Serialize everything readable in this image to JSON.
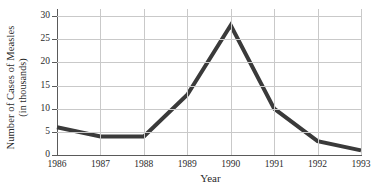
{
  "chart_data": {
    "type": "line",
    "title": "",
    "xlabel": "Year",
    "ylabel": "Number of Cases of Measles (in thousands)",
    "ylabel_line1": "Number of Cases of Measles",
    "ylabel_line2": "(in thousands)",
    "categories": [
      "1986",
      "1987",
      "1988",
      "1989",
      "1990",
      "1991",
      "1992",
      "1993"
    ],
    "values": [
      6,
      4,
      4,
      13,
      28,
      10,
      3,
      1
    ],
    "series": [
      {
        "name": "Measles cases",
        "values": [
          6,
          4,
          4,
          13,
          28,
          10,
          3,
          1
        ]
      }
    ],
    "x": [
      1986,
      1987,
      1988,
      1989,
      1990,
      1991,
      1992,
      1993
    ],
    "xlim": [
      1986,
      1993
    ],
    "ylim": [
      0,
      30
    ],
    "yticks": [
      0,
      5,
      10,
      15,
      20,
      25,
      30
    ],
    "ytick_labels": [
      "0",
      "5",
      "10",
      "15",
      "20",
      "25",
      "30"
    ],
    "xticks": [
      1986,
      1987,
      1988,
      1989,
      1990,
      1991,
      1992,
      1993
    ],
    "xtick_labels": [
      "1986",
      "1987",
      "1988",
      "1989",
      "1990",
      "1991",
      "1992",
      "1993"
    ],
    "grid": true,
    "grid_axis": "both",
    "legend": false,
    "legend_position": "none",
    "annotations": [],
    "line_color": "#3a3a3a",
    "grid_color": "#c9c9c9",
    "axis_color": "#5a5a5a",
    "background_color": "#ffffff",
    "line_width": 4
  }
}
